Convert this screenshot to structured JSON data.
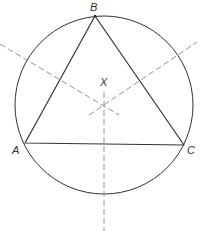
{
  "diagram": {
    "colors": {
      "background": "#ffffff",
      "stroke": "#333333",
      "dashed": "#888888"
    },
    "circle": {
      "cx": 104,
      "cy": 105,
      "r": 89
    },
    "points": {
      "A": {
        "label": "A",
        "x": 25,
        "y": 143,
        "label_x": 12,
        "label_y": 154
      },
      "B": {
        "label": "B",
        "x": 95,
        "y": 16,
        "label_x": 90,
        "label_y": 11
      },
      "C": {
        "label": "C",
        "x": 184,
        "y": 145,
        "label_x": 187,
        "label_y": 154
      },
      "X": {
        "label": "X",
        "x": 104,
        "y": 105,
        "label_x": 100,
        "label_y": 86
      }
    },
    "bisectors": [
      {
        "name": "perpendicular-bisector-ab",
        "x1": 0,
        "y1": 44,
        "x2": 119,
        "y2": 115
      },
      {
        "name": "perpendicular-bisector-bc",
        "x1": 89,
        "y1": 115,
        "x2": 197,
        "y2": 42
      },
      {
        "name": "perpendicular-bisector-ac",
        "x1": 104,
        "y1": 92,
        "x2": 104,
        "y2": 231
      }
    ]
  }
}
